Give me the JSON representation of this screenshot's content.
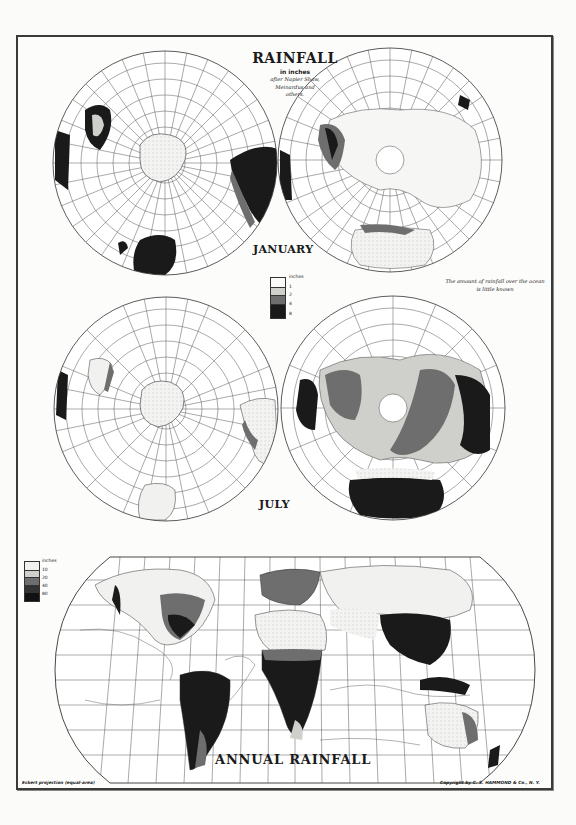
{
  "header": {
    "title": "RAINFALL",
    "subtitle": "in inches",
    "credit_line1": "after Napier Shaw,",
    "credit_line2": "Meinardus and",
    "credit_line3": "others."
  },
  "maps": {
    "january": {
      "label": "JANUARY"
    },
    "july": {
      "label": "JULY"
    },
    "annual": {
      "label": "ANNUAL RAINFALL"
    }
  },
  "note": {
    "line1": "The amount of rainfall over the ocean",
    "line2": "is little known"
  },
  "legend_monthly": {
    "unit": "inches",
    "values": [
      "1",
      "2",
      "4",
      "8"
    ],
    "colors": [
      "#f1f1ef",
      "#cfcfcc",
      "#6e6e6e",
      "#1a1a1a"
    ]
  },
  "legend_annual": {
    "unit": "inches",
    "values": [
      "10",
      "20",
      "40",
      "80"
    ],
    "colors": [
      "#f1f1ef",
      "#cfcfcc",
      "#6e6e6e",
      "#333333",
      "#111111"
    ]
  },
  "isohyet_labels": [
    "10",
    "20",
    "40",
    "60",
    "80"
  ],
  "footer": {
    "projection": "Eckert projection (equal-area)",
    "copyright": "Copyright by C. S. HAMMOND & Co., N. Y."
  }
}
